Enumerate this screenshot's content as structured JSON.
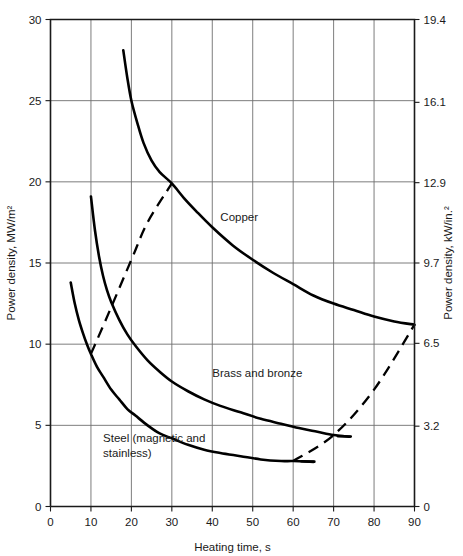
{
  "chart_data": {
    "type": "line",
    "title": "",
    "xlabel": "Heating time, s",
    "ylabel": "Power density, MW/m²",
    "y2label": "Power density, kW/in.²",
    "xlim": [
      0,
      90
    ],
    "ylim": [
      0,
      30
    ],
    "y2lim": [
      0,
      19.4
    ],
    "grid": true,
    "legend_position": "inline-annotations",
    "xticks": [
      0,
      10,
      20,
      30,
      40,
      50,
      60,
      70,
      80,
      90
    ],
    "xtick_labels": [
      "0",
      "10",
      "20",
      "30",
      "40",
      "50",
      "60",
      "70",
      "80",
      "90"
    ],
    "yticks": [
      0,
      5,
      10,
      15,
      20,
      25,
      30
    ],
    "ytick_labels": [
      "0",
      "5",
      "10",
      "15",
      "20",
      "25",
      "30"
    ],
    "y2ticks": [
      0,
      3.2,
      6.5,
      9.7,
      12.9,
      16.1,
      19.4
    ],
    "y2tick_labels": [
      "0",
      "3.2",
      "6.5",
      "9.7",
      "12.9",
      "16.1",
      "19.4"
    ],
    "series": [
      {
        "name": "Copper",
        "label": "Copper",
        "style": "solid",
        "label_x": 42,
        "label_y": 17.6,
        "points": [
          [
            18.0,
            28.1
          ],
          [
            19.0,
            26.4
          ],
          [
            20.0,
            25.0
          ],
          [
            21.5,
            23.6
          ],
          [
            23.0,
            22.4
          ],
          [
            25.0,
            21.3
          ],
          [
            27.0,
            20.6
          ],
          [
            30.0,
            19.9
          ],
          [
            33.0,
            19.0
          ],
          [
            36.0,
            18.2
          ],
          [
            40.0,
            17.2
          ],
          [
            45.0,
            16.1
          ],
          [
            50.0,
            15.2
          ],
          [
            55.0,
            14.4
          ],
          [
            60.0,
            13.7
          ],
          [
            65.0,
            13.0
          ],
          [
            70.0,
            12.5
          ],
          [
            75.0,
            12.1
          ],
          [
            80.0,
            11.7
          ],
          [
            85.0,
            11.4
          ],
          [
            90.0,
            11.2
          ]
        ]
      },
      {
        "name": "Brass and bronze",
        "label": "Brass and bronze",
        "style": "solid",
        "label_x": 40,
        "label_y": 8.0,
        "points": [
          [
            10.0,
            19.1
          ],
          [
            11.0,
            17.0
          ],
          [
            12.0,
            15.4
          ],
          [
            13.0,
            14.2
          ],
          [
            14.0,
            13.3
          ],
          [
            15.0,
            12.6
          ],
          [
            17.0,
            11.5
          ],
          [
            19.0,
            10.6
          ],
          [
            21.0,
            9.9
          ],
          [
            24.0,
            9.0
          ],
          [
            27.0,
            8.3
          ],
          [
            30.0,
            7.7
          ],
          [
            34.0,
            7.1
          ],
          [
            38.0,
            6.6
          ],
          [
            42.0,
            6.2
          ],
          [
            47.0,
            5.8
          ],
          [
            52.0,
            5.4
          ],
          [
            57.0,
            5.1
          ],
          [
            62.0,
            4.8
          ],
          [
            66.0,
            4.6
          ],
          [
            70.0,
            4.4
          ],
          [
            74.0,
            4.3
          ]
        ]
      },
      {
        "name": "Steel (magnetic and stainless)",
        "label": "Steel (magnetic and\nstainless)",
        "style": "solid",
        "label_x": 13,
        "label_y": 4.0,
        "points": [
          [
            5.0,
            13.8
          ],
          [
            6.0,
            12.5
          ],
          [
            7.0,
            11.5
          ],
          [
            8.0,
            10.7
          ],
          [
            9.0,
            10.0
          ],
          [
            10.0,
            9.4
          ],
          [
            11.5,
            8.6
          ],
          [
            13.0,
            8.0
          ],
          [
            15.0,
            7.2
          ],
          [
            17.0,
            6.6
          ],
          [
            19.0,
            6.0
          ],
          [
            21.0,
            5.6
          ],
          [
            24.0,
            5.0
          ],
          [
            27.0,
            4.5
          ],
          [
            30.0,
            4.2
          ],
          [
            34.0,
            3.8
          ],
          [
            38.0,
            3.5
          ],
          [
            42.0,
            3.3
          ],
          [
            47.0,
            3.1
          ],
          [
            52.0,
            2.9
          ],
          [
            57.0,
            2.8
          ],
          [
            60.0,
            2.8
          ],
          [
            65.0,
            2.75
          ]
        ]
      }
    ],
    "trend_lines": [
      {
        "name": "left-trend",
        "style": "dashed",
        "points": [
          [
            10.0,
            9.4
          ],
          [
            13.5,
            11.4
          ],
          [
            20.0,
            15.2
          ],
          [
            24.0,
            17.5
          ],
          [
            30.0,
            19.9
          ]
        ]
      },
      {
        "name": "right-trend",
        "style": "dashed",
        "points": [
          [
            60.0,
            2.8
          ],
          [
            70.0,
            4.4
          ],
          [
            80.0,
            7.2
          ],
          [
            90.0,
            11.2
          ]
        ]
      }
    ]
  }
}
